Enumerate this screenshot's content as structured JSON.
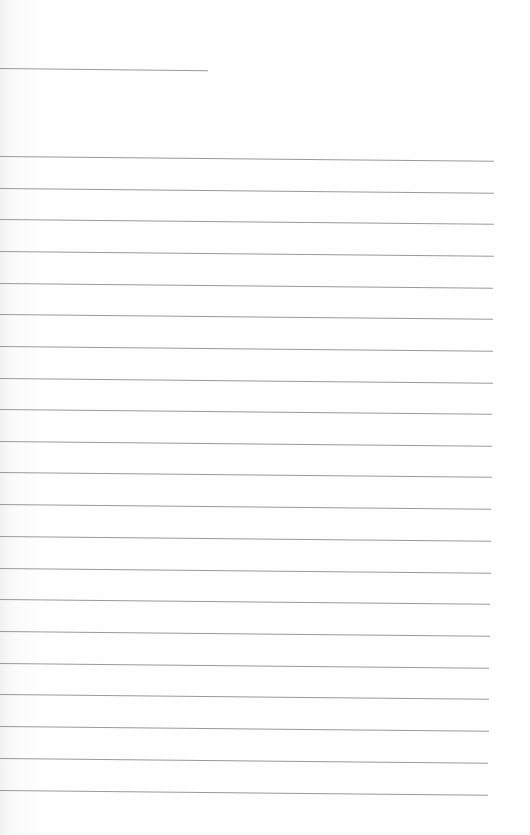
{
  "document": {
    "type": "lined-paper",
    "background": "#fdfdfd",
    "rule_color": "#9a9a9a",
    "header_rule": {
      "top": 68,
      "width": 208
    },
    "ghost_text": [
      "",
      ""
    ],
    "rules": [
      {
        "top": 156,
        "width": 494
      },
      {
        "top": 188,
        "width": 494
      },
      {
        "top": 219,
        "width": 494
      },
      {
        "top": 251,
        "width": 494
      },
      {
        "top": 283,
        "width": 493
      },
      {
        "top": 314,
        "width": 493
      },
      {
        "top": 346,
        "width": 493
      },
      {
        "top": 378,
        "width": 493
      },
      {
        "top": 409,
        "width": 492
      },
      {
        "top": 441,
        "width": 492
      },
      {
        "top": 472,
        "width": 492
      },
      {
        "top": 504,
        "width": 491
      },
      {
        "top": 536,
        "width": 491
      },
      {
        "top": 568,
        "width": 491
      },
      {
        "top": 599,
        "width": 490
      },
      {
        "top": 631,
        "width": 490
      },
      {
        "top": 663,
        "width": 489
      },
      {
        "top": 694,
        "width": 489
      },
      {
        "top": 726,
        "width": 489
      },
      {
        "top": 758,
        "width": 488
      },
      {
        "top": 790,
        "width": 488
      }
    ]
  }
}
